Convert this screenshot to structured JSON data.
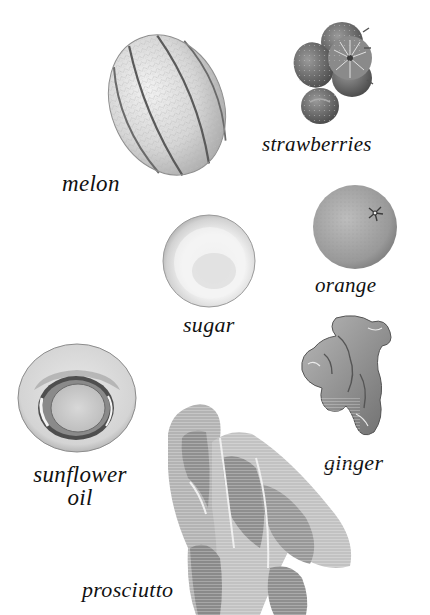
{
  "page": {
    "background": "#ffffff",
    "ink_color": "#111111"
  },
  "ingredients": [
    {
      "id": "melon",
      "label": "melon",
      "icon": "melon-icon"
    },
    {
      "id": "strawberries",
      "label": "strawberries",
      "icon": "strawberries-icon"
    },
    {
      "id": "orange",
      "label": "orange",
      "icon": "orange-icon"
    },
    {
      "id": "sugar",
      "label": "sugar",
      "icon": "sugar-bowl-icon"
    },
    {
      "id": "ginger",
      "label": "ginger",
      "icon": "ginger-root-icon"
    },
    {
      "id": "sunflower_oil",
      "label_line1": "sunflower",
      "label_line2": "oil",
      "icon": "oil-bowl-icon"
    },
    {
      "id": "prosciutto",
      "label": "prosciutto",
      "icon": "prosciutto-icon"
    }
  ]
}
